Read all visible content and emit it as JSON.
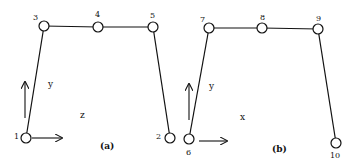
{
  "panels": [
    {
      "id": "a",
      "caption": "(a)",
      "caption_pos": [
        100,
        149
      ],
      "axis_labels": [
        {
          "text": "y",
          "pos": [
            48,
            87
          ]
        },
        {
          "text": "z",
          "pos": [
            80,
            118
          ]
        }
      ],
      "nodes": [
        {
          "id": "1",
          "x": 26,
          "y": 138,
          "label_pos": [
            14,
            139
          ]
        },
        {
          "id": "3",
          "x": 44,
          "y": 26,
          "label_pos": [
            33,
            20
          ]
        },
        {
          "id": "4",
          "x": 98,
          "y": 27,
          "label_pos": [
            95,
            17
          ]
        },
        {
          "id": "5",
          "x": 153,
          "y": 27,
          "label_pos": [
            150,
            18
          ]
        },
        {
          "id": "2",
          "x": 170,
          "y": 138,
          "label_pos": [
            156,
            139
          ]
        }
      ],
      "edges": [
        [
          "1",
          "3"
        ],
        [
          "3",
          "4"
        ],
        [
          "4",
          "5"
        ],
        [
          "5",
          "2"
        ]
      ],
      "arrows": [
        {
          "from": [
            25,
            118
          ],
          "to": [
            25,
            82
          ]
        },
        {
          "from": [
            32,
            138
          ],
          "to": [
            62,
            138
          ]
        }
      ]
    },
    {
      "id": "b",
      "caption": "(b)",
      "caption_pos": [
        272,
        152
      ],
      "axis_labels": [
        {
          "text": "y",
          "pos": [
            209,
            89
          ]
        },
        {
          "text": "x",
          "pos": [
            240,
            120
          ]
        }
      ],
      "nodes": [
        {
          "id": "6",
          "x": 189,
          "y": 139,
          "label_pos": [
            186,
            155
          ]
        },
        {
          "id": "7",
          "x": 209,
          "y": 28,
          "label_pos": [
            200,
            22
          ]
        },
        {
          "id": "8",
          "x": 262,
          "y": 28,
          "label_pos": [
            260,
            20
          ]
        },
        {
          "id": "9",
          "x": 318,
          "y": 29,
          "label_pos": [
            316,
            21
          ]
        },
        {
          "id": "10",
          "x": 336,
          "y": 143,
          "label_pos": [
            330,
            158
          ]
        }
      ],
      "edges": [
        [
          "6",
          "7"
        ],
        [
          "7",
          "8"
        ],
        [
          "8",
          "9"
        ],
        [
          "9",
          "10"
        ]
      ],
      "arrows": [
        {
          "from": [
            189,
            120
          ],
          "to": [
            189,
            84
          ]
        },
        {
          "from": [
            199,
            141
          ],
          "to": [
            227,
            141
          ]
        }
      ]
    }
  ],
  "style": {
    "stroke": "#111111",
    "node_radius": 5
  }
}
